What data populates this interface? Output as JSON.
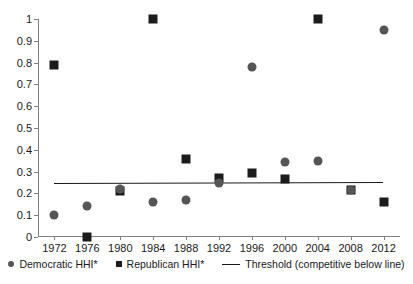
{
  "chart_data": {
    "type": "scatter",
    "title": "",
    "xlabel": "",
    "ylabel": "",
    "x": [
      1972,
      1976,
      1980,
      1984,
      1988,
      1992,
      1996,
      2000,
      2004,
      2008,
      2012
    ],
    "categories": [
      "1972",
      "1976",
      "1980",
      "1984",
      "1988",
      "1992",
      "1996",
      "2000",
      "2004",
      "2008",
      "2012"
    ],
    "xlim": [
      1970,
      2014
    ],
    "ylim": [
      0,
      1
    ],
    "ytick_labels": [
      "0",
      "0.1",
      "0.2",
      "0.3",
      "0.4",
      "0.5",
      "0.6",
      "0.7",
      "0.8",
      "0.9",
      "1"
    ],
    "ytick_values": [
      0,
      0.1,
      0.2,
      0.3,
      0.4,
      0.5,
      0.6,
      0.7,
      0.8,
      0.9,
      1
    ],
    "grid": false,
    "legend_position": "bottom",
    "series": [
      {
        "name": "Democratic HHI*",
        "marker": "circle",
        "color": "#555555",
        "values": [
          0.1,
          0.14,
          0.22,
          0.16,
          0.17,
          0.25,
          0.78,
          0.345,
          0.35,
          0.215,
          0.95
        ]
      },
      {
        "name": "Republican HHI*",
        "marker": "square",
        "color": "#1c1c1c",
        "values": [
          0.79,
          0.0,
          0.21,
          1.0,
          0.36,
          0.27,
          0.295,
          0.265,
          1.0,
          0.215,
          0.16
        ]
      },
      {
        "name": "Threshold (competitive below line)",
        "marker": "line",
        "color": "#1a1a1a",
        "values": [
          0.25,
          0.2505,
          0.251,
          0.2515,
          0.252,
          0.2525,
          0.253,
          0.2535,
          0.254,
          0.2545,
          0.255
        ]
      }
    ]
  },
  "legend": {
    "democratic_label": "Democratic HHI*",
    "republican_label": "Republican HHI*",
    "threshold_label": "Threshold (competitive below line)"
  },
  "axes": {
    "y_labels": [
      "1",
      "0.9",
      "0.8",
      "0.7",
      "0.6",
      "0.5",
      "0.4",
      "0.3",
      "0.2",
      "0.1",
      "0"
    ],
    "x_labels": [
      "1972",
      "1976",
      "1980",
      "1984",
      "1988",
      "1992",
      "1996",
      "2000",
      "2004",
      "2008",
      "2012"
    ]
  },
  "colors": {
    "democratic": "#555555",
    "republican": "#1c1c1c",
    "threshold": "#6b6b6b",
    "axis": "#808080",
    "background": "#ffffff"
  }
}
